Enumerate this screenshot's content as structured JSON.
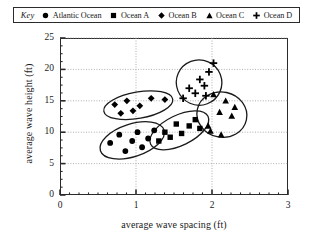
{
  "legend": {
    "key_label": "Key",
    "entries": [
      {
        "label": "Atlantic Ocean",
        "marker": "circle-marker-icon",
        "color": "#000000"
      },
      {
        "label": "Ocean A",
        "marker": "square-marker-icon",
        "color": "#000000"
      },
      {
        "label": "Ocean B",
        "marker": "diamond-marker-icon",
        "color": "#000000"
      },
      {
        "label": "Ocean C",
        "marker": "triangle-marker-icon",
        "color": "#000000"
      },
      {
        "label": "Ocean D",
        "marker": "plus-marker-icon",
        "color": "#000000"
      }
    ]
  },
  "axes": {
    "x_ticks": [
      "0",
      "1",
      "2",
      "3"
    ],
    "y_ticks": [
      "0",
      "5",
      "10",
      "15",
      "20",
      "25"
    ]
  },
  "chart_data": {
    "type": "scatter",
    "title": "",
    "xlabel": "average wave spacing (ft)",
    "ylabel": "average wave height (ft)",
    "xlim": [
      0,
      3
    ],
    "ylim": [
      0,
      25
    ],
    "x_ticks": [
      0,
      1,
      2,
      3
    ],
    "y_ticks": [
      0,
      5,
      10,
      15,
      20,
      25
    ],
    "x_minor_tick_step": 0.125,
    "y_minor_tick_step": 1.25,
    "grid": "dotted gridlines at major ticks",
    "legend_position": "top, boxed, horizontal",
    "cluster_outlines": "each series enclosed by a hand-drawn ellipse",
    "series": [
      {
        "name": "Atlantic Ocean",
        "marker": "circle",
        "color": "#000000",
        "points": [
          [
            0.66,
            8.3
          ],
          [
            0.78,
            9.6
          ],
          [
            0.86,
            7.0
          ],
          [
            0.95,
            8.6
          ],
          [
            1.02,
            10.0
          ],
          [
            1.08,
            7.6
          ],
          [
            1.16,
            9.0
          ],
          [
            1.24,
            10.3
          ]
        ],
        "ellipse": {
          "cx": 0.95,
          "cy": 8.7,
          "rx": 0.44,
          "ry": 2.6,
          "angle": -18
        }
      },
      {
        "name": "Ocean A",
        "marker": "square",
        "color": "#000000",
        "points": [
          [
            1.3,
            8.6
          ],
          [
            1.38,
            10.0
          ],
          [
            1.45,
            9.2
          ],
          [
            1.53,
            11.3
          ],
          [
            1.6,
            9.8
          ],
          [
            1.7,
            11.0
          ],
          [
            1.78,
            12.0
          ],
          [
            1.84,
            10.6
          ]
        ],
        "ellipse": {
          "cx": 1.57,
          "cy": 10.3,
          "rx": 0.42,
          "ry": 2.4,
          "angle": -26
        }
      },
      {
        "name": "Ocean B",
        "marker": "diamond",
        "color": "#000000",
        "points": [
          [
            0.72,
            14.4
          ],
          [
            0.8,
            13.0
          ],
          [
            0.88,
            15.0
          ],
          [
            0.96,
            13.4
          ],
          [
            1.05,
            14.2
          ],
          [
            1.2,
            15.4
          ],
          [
            1.38,
            15.2
          ]
        ],
        "ellipse": {
          "cx": 1.03,
          "cy": 14.3,
          "rx": 0.46,
          "ry": 2.1,
          "angle": -10
        }
      },
      {
        "name": "Ocean C",
        "marker": "triangle",
        "color": "#000000",
        "points": [
          [
            1.95,
            11.0
          ],
          [
            2.02,
            16.0
          ],
          [
            2.1,
            13.2
          ],
          [
            2.18,
            15.0
          ],
          [
            2.26,
            12.6
          ],
          [
            2.12,
            9.6
          ],
          [
            1.98,
            10.2
          ],
          [
            2.3,
            14.0
          ]
        ],
        "ellipse": {
          "cx": 2.13,
          "cy": 12.8,
          "rx": 0.33,
          "ry": 3.6,
          "angle": 12
        }
      },
      {
        "name": "Ocean D",
        "marker": "plus",
        "color": "#000000",
        "points": [
          [
            1.62,
            15.4
          ],
          [
            1.7,
            17.0
          ],
          [
            1.78,
            16.2
          ],
          [
            1.84,
            18.4
          ],
          [
            1.9,
            17.4
          ],
          [
            1.96,
            19.6
          ],
          [
            2.02,
            21.0
          ],
          [
            1.92,
            15.8
          ]
        ],
        "ellipse": {
          "cx": 1.83,
          "cy": 17.9,
          "rx": 0.3,
          "ry": 3.6,
          "angle": 24
        }
      }
    ]
  }
}
